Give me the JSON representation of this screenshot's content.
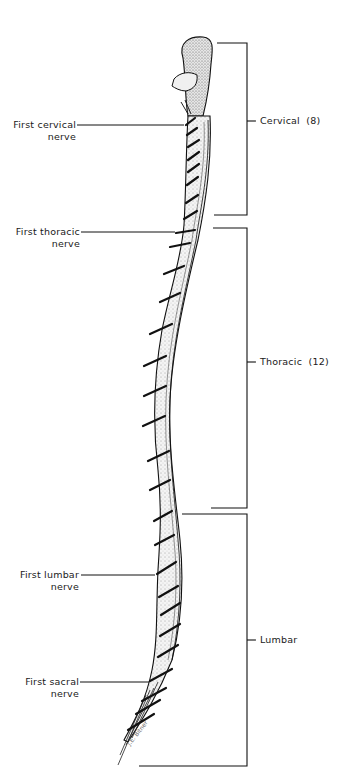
{
  "figure": {
    "nerve_labels": [
      {
        "line1": "First cervical",
        "line2": "nerve"
      },
      {
        "line1": "First thoracic",
        "line2": "nerve"
      },
      {
        "line1": "First lumbar",
        "line2": "nerve"
      },
      {
        "line1": "First sacral",
        "line2": "nerve"
      }
    ],
    "regions": [
      {
        "label": "Cervical  (8)"
      },
      {
        "label": "Thoracic  (12)"
      },
      {
        "label": "Lumbar"
      }
    ],
    "signature": "J.E. Bitner"
  }
}
